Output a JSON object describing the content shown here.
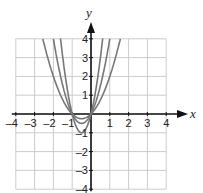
{
  "chart_data": {
    "type": "line",
    "title": "",
    "xlabel": "x",
    "ylabel": "y",
    "xlim": [
      -4,
      4
    ],
    "ylim": [
      -4,
      4
    ],
    "grid": true,
    "x_ticks": [
      "-4",
      "-3",
      "-2",
      "-1",
      "1",
      "2",
      "3",
      "4"
    ],
    "y_ticks": [
      "4",
      "3",
      "2",
      "1",
      "-1",
      "-2",
      "-3",
      "-4"
    ],
    "series": [
      {
        "name": "curve-1",
        "expr": "y = x^2 + x",
        "color": "#777777"
      },
      {
        "name": "curve-2",
        "expr": "y = 2x^2 + 2x",
        "color": "#777777"
      },
      {
        "name": "curve-3",
        "expr": "y = 4x^2 + 4x",
        "color": "#777777"
      }
    ]
  },
  "labels": {
    "x": "x",
    "y": "y"
  },
  "colors": {
    "grid": "#cccccc",
    "axis": "#111111",
    "curve": "#777777"
  }
}
